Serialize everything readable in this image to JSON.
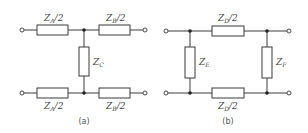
{
  "figure": {
    "panels": [
      {
        "id": "a",
        "caption": "(a)",
        "type": "T-network",
        "components": [
          {
            "name": "ZA-top",
            "symbol": "Z",
            "sub": "A",
            "suffix": "/2",
            "position": "top-left series"
          },
          {
            "name": "ZB-top",
            "symbol": "Z",
            "sub": "B",
            "suffix": "/2",
            "position": "top-right series"
          },
          {
            "name": "ZC",
            "symbol": "Z",
            "sub": "C",
            "suffix": "",
            "position": "center shunt"
          },
          {
            "name": "ZA-bottom",
            "symbol": "Z",
            "sub": "A",
            "suffix": "/2",
            "position": "bottom-left series"
          },
          {
            "name": "ZB-bottom",
            "symbol": "Z",
            "sub": "B",
            "suffix": "/2",
            "position": "bottom-right series"
          }
        ]
      },
      {
        "id": "b",
        "caption": "(b)",
        "type": "Pi-network",
        "components": [
          {
            "name": "ZD-top",
            "symbol": "Z",
            "sub": "D",
            "suffix": "/2",
            "position": "top series"
          },
          {
            "name": "ZE",
            "symbol": "Z",
            "sub": "E",
            "suffix": "",
            "position": "left shunt"
          },
          {
            "name": "ZF",
            "symbol": "Z",
            "sub": "F",
            "suffix": "",
            "position": "right shunt"
          },
          {
            "name": "ZD-bottom",
            "symbol": "Z",
            "sub": "D",
            "suffix": "/2",
            "position": "bottom series"
          }
        ]
      }
    ]
  }
}
